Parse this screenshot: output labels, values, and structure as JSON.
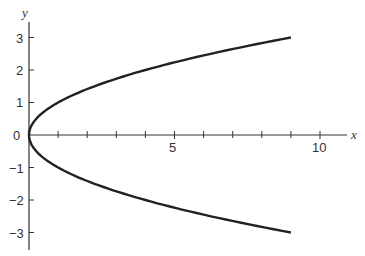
{
  "chart_data": {
    "type": "line",
    "title": "",
    "xlabel": "x",
    "ylabel": "y",
    "equation": "x = y^2",
    "xlim": [
      0,
      11
    ],
    "ylim": [
      -3.5,
      3.5
    ],
    "grid": false,
    "x_ticks": [
      1,
      2,
      3,
      4,
      5,
      6,
      7,
      8,
      9,
      10
    ],
    "x_tick_labels": {
      "5": "5",
      "10": "10"
    },
    "y_ticks": [
      -3,
      -2,
      -1,
      0,
      1,
      2,
      3
    ],
    "y_tick_labels": [
      "-3",
      "-2",
      "-1",
      "0",
      "1",
      "2",
      "3"
    ],
    "series": [
      {
        "name": "x = y^2",
        "y": [
          -3,
          -2.5,
          -2,
          -1.5,
          -1,
          -0.5,
          0,
          0.5,
          1,
          1.5,
          2,
          2.5,
          3
        ],
        "x": [
          9,
          6.25,
          4,
          2.25,
          1,
          0.25,
          0,
          0.25,
          1,
          2.25,
          4,
          6.25,
          9
        ]
      }
    ]
  },
  "labels": {
    "x_axis": "x",
    "y_axis": "y",
    "origin": "0",
    "x5": "5",
    "x10": "10",
    "y3": "3",
    "y2": "2",
    "y1": "1",
    "ym1": "−1",
    "ym2": "−2",
    "ym3": "−3"
  }
}
